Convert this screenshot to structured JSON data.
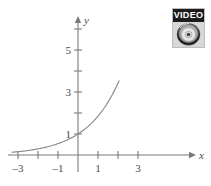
{
  "figure": {
    "background_color": "#ffffff",
    "curve_color": "#8a8a8a",
    "axis_color": "#7a7a7a",
    "label_color": "#4a4a4a"
  },
  "badge": {
    "name": "video-badge",
    "word": "VIDEO",
    "icon": "dvd-disc-icon",
    "frame_color": "#d8d8d8",
    "word_background": "#1c1c1c",
    "word_color": "#ffffff"
  },
  "chart_data": {
    "type": "line",
    "title": "",
    "subtitle": "",
    "xlabel": "x",
    "ylabel": "y",
    "grid": false,
    "legend": null,
    "annotations": [],
    "xlim": [
      -3.4,
      3.9
    ],
    "ylim": [
      -0.55,
      7.4
    ],
    "xticks": [
      -3,
      -2,
      -1,
      1,
      2,
      3
    ],
    "xtick_labels": [
      "-3",
      "",
      "-1",
      "1",
      "",
      "3"
    ],
    "yticks": [
      1,
      2,
      3,
      4,
      5,
      6
    ],
    "ytick_labels": [
      "1",
      "",
      "3",
      "",
      "5",
      ""
    ],
    "series": [
      {
        "name": "exponential",
        "equation": "y = a^x",
        "x": [
          -3.3,
          -3.0,
          -2.5,
          -2.0,
          -1.5,
          -1.0,
          -0.5,
          0.0,
          0.5,
          1.0,
          1.5,
          2.0
        ],
        "y": [
          0.14,
          0.16,
          0.22,
          0.3,
          0.41,
          0.55,
          0.75,
          1.0,
          1.36,
          1.85,
          2.52,
          3.42
        ]
      }
    ],
    "curve_endpoints": {
      "left": [
        -3.3,
        0.14
      ],
      "right": [
        2.05,
        7.1
      ]
    }
  }
}
